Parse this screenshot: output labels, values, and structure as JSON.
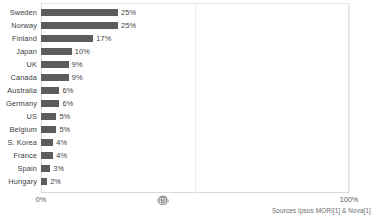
{
  "chart_data": {
    "type": "bar",
    "orientation": "horizontal",
    "title": "",
    "subtitle": "",
    "xlabel": "",
    "ylabel": "",
    "xlim": [
      0,
      100
    ],
    "grid": true,
    "legend": null,
    "value_suffix": "%",
    "categories": [
      "Sweden",
      "Norway",
      "Finland",
      "Japan",
      "UK",
      "Canada",
      "Australia",
      "Germany",
      "US",
      "Belgium",
      "S. Korea",
      "France",
      "Spain",
      "Hungary"
    ],
    "values": [
      25,
      25,
      17,
      10,
      9,
      9,
      6,
      6,
      5,
      5,
      4,
      4,
      3,
      2
    ],
    "value_labels": [
      "25%",
      "25%",
      "17%",
      "10%",
      "9%",
      "9%",
      "6%",
      "6%",
      "5%",
      "5%",
      "4%",
      "4%",
      "3%",
      "2%"
    ],
    "bar_color": "#5c5c5c",
    "background_color": "#ffffff",
    "axis": {
      "min_label": "0%",
      "max_label": "100%",
      "tick_labels": [
        "0%",
        "100%"
      ]
    }
  },
  "annotations": {
    "source_note": "Sources Ipsos MORI[1] & Nova[1]",
    "mid_axis_glyph": "🐵"
  }
}
